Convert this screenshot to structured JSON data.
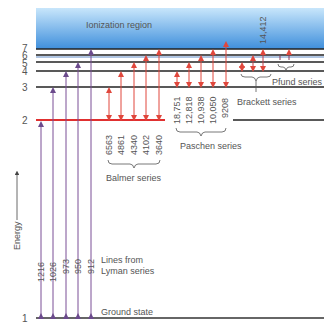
{
  "ionization_label": "Ionization region",
  "energy_axis_label": "Energy",
  "ground_state_label": "Ground state",
  "levels": [
    {
      "n": "1",
      "y": 318
    },
    {
      "n": "2",
      "y": 120
    },
    {
      "n": "3",
      "y": 87
    },
    {
      "n": "4",
      "y": 71
    },
    {
      "n": "5",
      "y": 62
    },
    {
      "n": "6",
      "y": 55
    },
    {
      "n": "7",
      "y": 49
    }
  ],
  "series": {
    "lyman": {
      "label_line1": "Lines from",
      "label_line2": "Lyman series",
      "color": "#7a4f96",
      "wavelengths": [
        "1216",
        "1026",
        "973",
        "950",
        "912"
      ]
    },
    "balmer": {
      "label": "Balmer series",
      "color": "#e0473c",
      "wavelengths": [
        "6563",
        "4861",
        "4340",
        "4102",
        "3640"
      ]
    },
    "paschen": {
      "label": "Paschen series",
      "color": "#e0473c",
      "wavelengths": [
        "18,751",
        "12,818",
        "10,938",
        "10,050",
        "9208"
      ]
    },
    "brackett": {
      "label": "Brackett series",
      "color": "#c0404a",
      "wavelengths": [
        "14,412"
      ]
    },
    "pfund": {
      "label": "Pfund series",
      "color": "#8a3a5a"
    }
  },
  "colors": {
    "ionization_top": "#a9d3f2",
    "ionization_bottom": "#4a90d9",
    "level_line": "#222222",
    "level2_line": "#e03030"
  }
}
